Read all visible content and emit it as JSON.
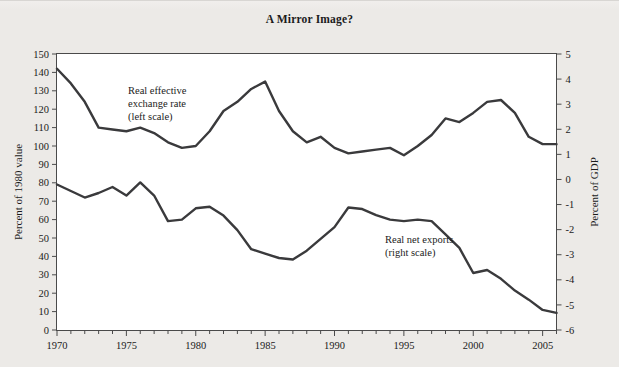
{
  "title": "A Mirror Image?",
  "axes": {
    "left_label": "Percent of 1980 value",
    "right_label": "Percent of GDP",
    "left_ticks": [
      "0",
      "10",
      "20",
      "30",
      "40",
      "50",
      "60",
      "70",
      "80",
      "90",
      "100",
      "110",
      "120",
      "130",
      "140",
      "150"
    ],
    "right_ticks": [
      "-6",
      "-5",
      "-4",
      "-3",
      "-2",
      "-1",
      "0",
      "1",
      "2",
      "3",
      "4",
      "5"
    ],
    "x_ticks": [
      "1970",
      "1975",
      "1980",
      "1985",
      "1990",
      "1995",
      "2000",
      "2005"
    ]
  },
  "annotations": {
    "series1_line1": "Real effective",
    "series1_line2": "exchange rate",
    "series1_line3": "(left scale)",
    "series2_line1": "Real net exports",
    "series2_line2": "(right scale)"
  },
  "colors": {
    "line": "#3a3a3c",
    "page_background": "#eceae7",
    "plot_background": "#ffffff",
    "frame": "#4a4a4a"
  },
  "chart_data": {
    "type": "line",
    "title": "A Mirror Image?",
    "xlabel": "",
    "ylabel": "Percent of 1980 value",
    "y2label": "Percent of GDP",
    "xlim": [
      1970,
      2006
    ],
    "ylim": [
      0,
      150
    ],
    "y2lim": [
      -6,
      5
    ],
    "grid": false,
    "legend": "annotations-inline",
    "x": [
      1970,
      1971,
      1972,
      1973,
      1974,
      1975,
      1976,
      1977,
      1978,
      1979,
      1980,
      1981,
      1982,
      1983,
      1984,
      1985,
      1986,
      1987,
      1988,
      1989,
      1990,
      1991,
      1992,
      1993,
      1994,
      1995,
      1996,
      1997,
      1998,
      1999,
      2000,
      2001,
      2002,
      2003,
      2004,
      2005,
      2006
    ],
    "series": [
      {
        "name": "Real effective exchange rate (left scale)",
        "axis": "left",
        "units": "Percent of 1980 value",
        "values": [
          142,
          134,
          124,
          110,
          109,
          108,
          110,
          107,
          102,
          99,
          100,
          108,
          119,
          124,
          131,
          135,
          119,
          108,
          102,
          105,
          99,
          96,
          97,
          98,
          99,
          95,
          100,
          106,
          115,
          113,
          118,
          124,
          125,
          118,
          105,
          101,
          101
        ]
      },
      {
        "name": "Real net exports (right scale)",
        "axis": "right",
        "units": "Percent of GDP",
        "values_left_scale": [
          87,
          83,
          79,
          82,
          86,
          81,
          95,
          81,
          67,
          68,
          75,
          76,
          70,
          60,
          47,
          44,
          41,
          40,
          46,
          54,
          62,
          75,
          74,
          70,
          67,
          66,
          67,
          66,
          57,
          48,
          31,
          33,
          27,
          19,
          13,
          6,
          4
        ],
        "values": [
          -0.2,
          -0.46,
          -0.72,
          -0.54,
          -0.3,
          -0.64,
          -0.12,
          -0.64,
          -1.66,
          -1.6,
          -1.15,
          -1.09,
          -1.44,
          -2.02,
          -2.78,
          -2.96,
          -3.13,
          -3.19,
          -2.84,
          -2.37,
          -1.9,
          -1.12,
          -1.18,
          -1.42,
          -1.6,
          -1.66,
          -1.6,
          -1.66,
          -2.19,
          -2.73,
          -3.73,
          -3.61,
          -3.96,
          -4.43,
          -4.79,
          -5.2,
          -5.32
        ]
      }
    ]
  }
}
